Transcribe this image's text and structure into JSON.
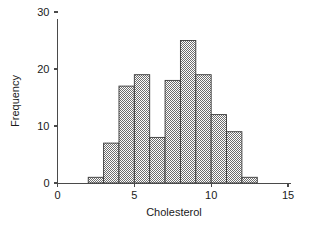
{
  "chart_data": {
    "type": "bar",
    "title": "",
    "subtitle": "",
    "xlabel": "Cholesterol",
    "ylabel": "Frequency",
    "xlim": [
      0,
      15
    ],
    "ylim": [
      0,
      31
    ],
    "grid": false,
    "legend": null,
    "bin_width": 1,
    "bin_edges": [
      2,
      3,
      4,
      5,
      6,
      7,
      8,
      9,
      10,
      11,
      12,
      13
    ],
    "categories": [
      "2-3",
      "3-4",
      "4-5",
      "5-6",
      "6-7",
      "7-8",
      "8-9",
      "9-10",
      "10-11",
      "11-12",
      "12-13"
    ],
    "values": [
      1,
      7,
      17,
      19,
      8,
      18,
      25,
      19,
      12,
      9,
      1
    ],
    "x_ticks": [
      0,
      5,
      10,
      15
    ],
    "x_tick_labels": [
      "0",
      "5",
      "10",
      "15"
    ],
    "y_ticks": [
      0,
      10,
      20,
      30
    ],
    "y_tick_labels": [
      "0",
      "10",
      "20",
      "30"
    ],
    "bar_fill_color": "#8c8c8c",
    "bar_edge_color": "#3a3a3a",
    "axis_color": "#4a4a4a",
    "background_color": "#ffffff",
    "total_count": 136
  },
  "axes": {
    "x_title": "Cholesterol",
    "y_title": "Frequency"
  }
}
